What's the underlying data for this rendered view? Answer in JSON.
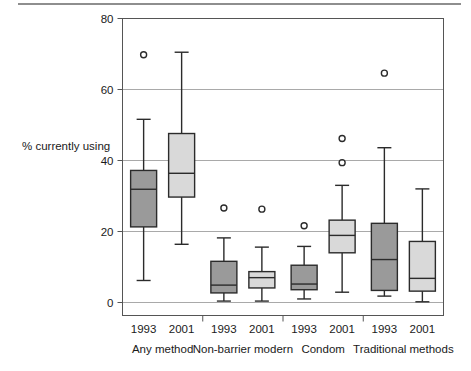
{
  "chart_data": {
    "type": "box",
    "title": "",
    "xlabel": "",
    "ylabel": "% currently using",
    "ylim": [
      0,
      80
    ],
    "yticks": [
      0,
      20,
      40,
      60,
      80
    ],
    "ytick_labels": [
      "0",
      "20",
      "40",
      "60",
      "80"
    ],
    "grid": "horizontal",
    "legend": "none",
    "groups": [
      {
        "name": "Any method",
        "boxes": [
          {
            "label": "1993",
            "fill": "#9a9a9a",
            "whisker_low": 6.2,
            "q1": 21.3,
            "median": 31.9,
            "q3": 37.2,
            "whisker_high": 51.6,
            "outliers": [
              69.8
            ]
          },
          {
            "label": "2001",
            "fill": "#d9d9d9",
            "whisker_low": 16.4,
            "q1": 29.7,
            "median": 36.4,
            "q3": 47.6,
            "whisker_high": 70.5,
            "outliers": []
          }
        ]
      },
      {
        "name": "Non-barrier modern",
        "boxes": [
          {
            "label": "1993",
            "fill": "#9a9a9a",
            "whisker_low": 0.4,
            "q1": 2.7,
            "median": 4.9,
            "q3": 11.6,
            "whisker_high": 18.2,
            "outliers": [
              26.6
            ]
          },
          {
            "label": "2001",
            "fill": "#d9d9d9",
            "whisker_low": 0.4,
            "q1": 4.1,
            "median": 7.0,
            "q3": 8.7,
            "whisker_high": 15.6,
            "outliers": [
              26.3
            ]
          }
        ]
      },
      {
        "name": "Condom",
        "boxes": [
          {
            "label": "1993",
            "fill": "#9a9a9a",
            "whisker_low": 1.0,
            "q1": 3.6,
            "median": 5.2,
            "q3": 10.5,
            "whisker_high": 15.8,
            "outliers": [
              21.6
            ]
          },
          {
            "label": "2001",
            "fill": "#d9d9d9",
            "whisker_low": 2.9,
            "q1": 14.0,
            "median": 18.9,
            "q3": 23.2,
            "whisker_high": 33.0,
            "outliers": [
              39.4,
              46.2
            ]
          }
        ]
      },
      {
        "name": "Traditional methods",
        "boxes": [
          {
            "label": "1993",
            "fill": "#9a9a9a",
            "whisker_low": 1.8,
            "q1": 3.4,
            "median": 12.1,
            "q3": 22.3,
            "whisker_high": 43.6,
            "outliers": [
              64.6
            ]
          },
          {
            "label": "2001",
            "fill": "#d9d9d9",
            "whisker_low": 0.2,
            "q1": 3.2,
            "median": 6.8,
            "q3": 17.2,
            "whisker_high": 32.0,
            "outliers": []
          }
        ]
      }
    ],
    "colors": {
      "dark_box": "#9a9a9a",
      "light_box": "#d9d9d9",
      "outline": "#2b2b2b",
      "gridline": "#a9a9a9",
      "axis": "#555555"
    }
  }
}
